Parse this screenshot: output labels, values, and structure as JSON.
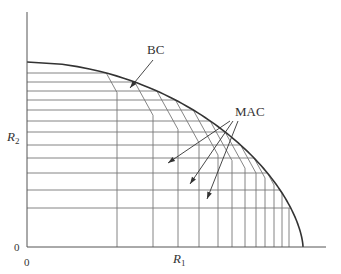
{
  "figure": {
    "axes": {
      "origin": [
        27,
        247
      ],
      "x_end": 326,
      "y_top": 12,
      "x_label": "R",
      "x_label_sub": "1",
      "y_label": "R",
      "y_label_sub": "2",
      "x_origin_tick": "0",
      "y_origin_tick": "0"
    },
    "labels": {
      "bc": "BC",
      "mac": "MAC"
    },
    "bc_curve": {
      "start": [
        27,
        62
      ],
      "end": [
        303,
        247
      ]
    },
    "horizontal_levels": [
      73,
      82,
      91,
      100,
      110,
      121,
      132,
      145,
      158,
      173,
      190,
      208
    ],
    "vertical_levels": [
      117,
      153,
      178,
      199,
      218,
      232,
      245,
      256,
      265,
      274,
      282,
      289
    ],
    "mac_slope_dx_per_dy": 0.55,
    "bc_arrow": {
      "from": [
        153,
        60
      ],
      "to": [
        130,
        88
      ]
    },
    "mac_arrows": [
      {
        "from": [
          230,
          121
        ],
        "to": [
          168,
          163
        ]
      },
      {
        "from": [
          233,
          121
        ],
        "to": [
          190,
          184
        ]
      },
      {
        "from": [
          238,
          121
        ],
        "to": [
          207,
          199
        ]
      }
    ],
    "colors": {
      "axis": "#555555",
      "grid": "#777777",
      "bc": "#333333",
      "text": "#333333"
    }
  }
}
